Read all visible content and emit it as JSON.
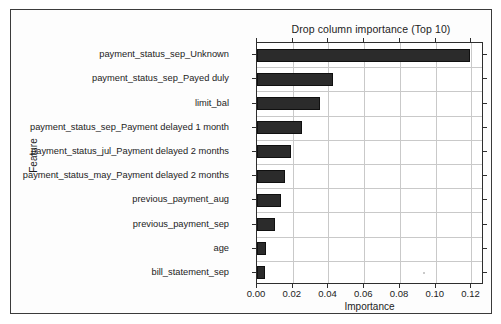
{
  "figure": {
    "title": "Drop column importance (Top 10)",
    "background_color": "#ffffff",
    "frame_color": "#3b3b3b",
    "bar_color": "#2b2b2b",
    "grid_color": "#c9c9c9"
  },
  "chart_data": {
    "type": "bar",
    "orientation": "horizontal",
    "title": "Drop column importance (Top 10)",
    "xlabel": "Importance",
    "ylabel": "Feature",
    "grid": true,
    "legend": null,
    "xlim": [
      0.0,
      0.127
    ],
    "xticks": [
      "0.00",
      "0.02",
      "0.04",
      "0.06",
      "0.08",
      "0.10",
      "0.12"
    ],
    "xtick_values": [
      0.0,
      0.02,
      0.04,
      0.06,
      0.08,
      0.1,
      0.12
    ],
    "categories": [
      "payment_status_sep_Unknown",
      "payment_status_sep_Payed duly",
      "limit_bal",
      "payment_status_sep_Payment delayed 1 month",
      "payment_status_jul_Payment delayed 2 months",
      "payment_status_may_Payment delayed 2 months",
      "previous_payment_aug",
      "previous_payment_sep",
      "age",
      "bill_statement_sep"
    ],
    "values": [
      0.119,
      0.0427,
      0.0354,
      0.0253,
      0.019,
      0.0158,
      0.0137,
      0.01,
      0.0048,
      0.0045
    ]
  }
}
